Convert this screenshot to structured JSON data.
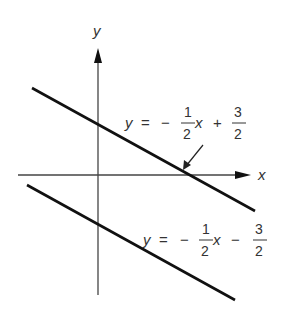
{
  "diagram": {
    "axes": {
      "x_label": "x",
      "y_label": "y"
    },
    "lines": [
      {
        "name": "upper-line",
        "equation": "y = -1/2 x + 3/2",
        "label": {
          "lhs": "y",
          "eq": "=",
          "minus": "−",
          "num": "1",
          "den": "2",
          "var": "x",
          "op": "+",
          "cnum": "3",
          "cden": "2"
        }
      },
      {
        "name": "lower-line",
        "equation": "y = -1/2 x - 3/2",
        "label": {
          "lhs": "y",
          "eq": "=",
          "minus": "−",
          "num": "1",
          "den": "2",
          "var": "x",
          "op": "−",
          "cnum": "3",
          "cden": "2"
        }
      }
    ],
    "colors": {
      "line": "#111111",
      "text": "#333333",
      "background": "#ffffff"
    }
  }
}
